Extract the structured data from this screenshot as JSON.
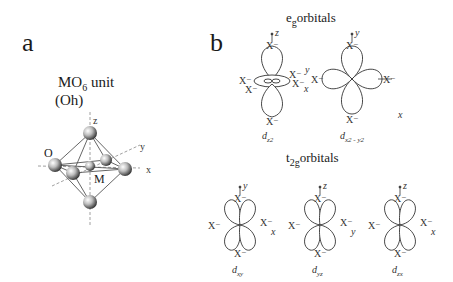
{
  "panel_a": {
    "label": "a",
    "title_main": "MO",
    "title_sub": "6",
    "title_rest": " unit",
    "symmetry": "(Oh)",
    "atom_labels": {
      "oxygen": "O",
      "metal": "M"
    },
    "axis_labels": {
      "z": "z",
      "y": "y",
      "x": "x"
    }
  },
  "panel_b": {
    "label": "b",
    "eg": {
      "title_main": "e",
      "title_sub": "g",
      "title_rest": "orbitals",
      "orbitals": [
        {
          "name": "dz2",
          "caption_base": "d",
          "caption_sub": "z2"
        },
        {
          "name": "dx2-y2",
          "caption_base": "d",
          "caption_sub": "x2 - y2"
        }
      ],
      "stray_label": "x"
    },
    "t2g": {
      "title_main": "t",
      "title_sub": "2g",
      "title_rest": "orbitals",
      "orbitals": [
        {
          "name": "dxy",
          "caption_base": "d",
          "caption_sub": "xy",
          "axis_up": "y",
          "axis_right": "x"
        },
        {
          "name": "dyz",
          "caption_base": "d",
          "caption_sub": "yz",
          "axis_up": "z",
          "axis_right": "y"
        },
        {
          "name": "dzx",
          "caption_base": "d",
          "caption_sub": "zx",
          "axis_up": "z",
          "axis_right": "x"
        }
      ]
    },
    "ligand_label": "X⁻",
    "dz2_axes": {
      "up": "z",
      "right": "x",
      "diag": "y"
    },
    "dx2y2_axes": {
      "up": "y",
      "right": "x"
    }
  },
  "colors": {
    "line": "#333333",
    "lobe_fill": "#ffffff",
    "sphere_light": "#f2f2f2",
    "sphere_dark": "#3a3a3a"
  }
}
